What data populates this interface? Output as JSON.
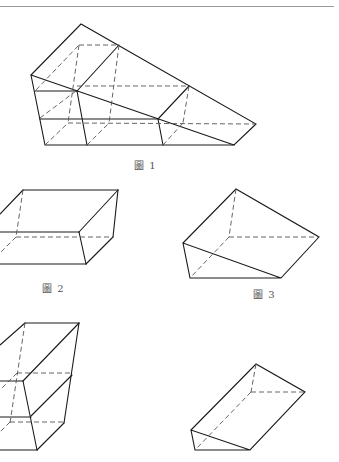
{
  "figures": [
    {
      "id": "fig1",
      "caption": "圖 1",
      "shape": "compound stepped solid composed of stacked prisms"
    },
    {
      "id": "fig2",
      "caption": "圖 2",
      "shape": "quadrilateral prism (trapezoidal block)"
    },
    {
      "id": "fig3",
      "caption": "圖 3",
      "shape": "triangular prism / wedge"
    },
    {
      "id": "fig4",
      "caption": "",
      "shape": "tall trapezoidal prism with middle cut"
    },
    {
      "id": "fig5",
      "caption": "",
      "shape": "triangular prism"
    }
  ],
  "colors": {
    "line": "#1a1a1a",
    "hidden_line": "#555555",
    "header_rule": "#9a9a9a"
  }
}
